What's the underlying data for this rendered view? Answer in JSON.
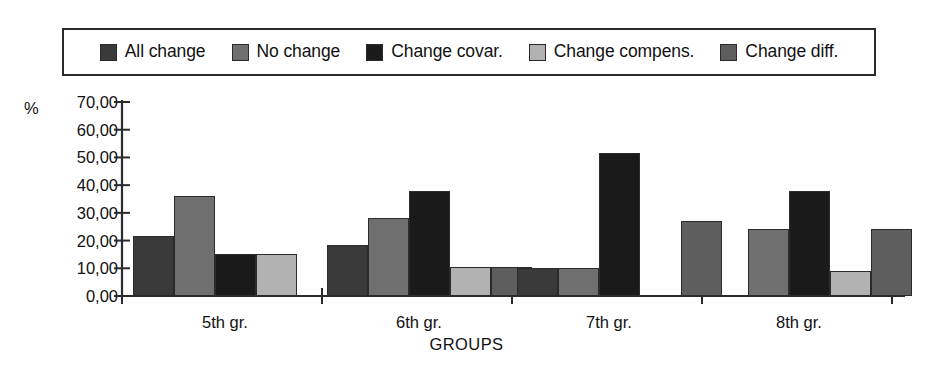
{
  "legend": {
    "position": "top",
    "bordered": true,
    "entries": [
      {
        "label": "All change",
        "color": "#3a3a3a"
      },
      {
        "label": "No change",
        "color": "#6f6f6f"
      },
      {
        "label": "Change covar.",
        "color": "#1a1a1a"
      },
      {
        "label": "Change compens.",
        "color": "#b2b2b2"
      },
      {
        "label": "Change diff.",
        "color": "#5e5e5e"
      }
    ]
  },
  "axes": {
    "y_title": "%",
    "x_title": "GROUPS",
    "y_tick_labels": [
      "70,00",
      "60,00",
      "50,00",
      "40,00",
      "30,00",
      "20,00",
      "10,00",
      "0,00"
    ]
  },
  "chart_data": {
    "type": "bar",
    "title": "",
    "subtitle": "",
    "xlabel": "GROUPS",
    "ylabel": "%",
    "ylim": [
      0,
      70
    ],
    "ytick_step": 10,
    "ytick_labels": [
      "0,00",
      "10,00",
      "20,00",
      "30,00",
      "40,00",
      "50,00",
      "60,00",
      "70,00"
    ],
    "grid": false,
    "legend_position": "top",
    "decimal_separator": ",",
    "categories": [
      "5th gr.",
      "6th gr.",
      "7th gr.",
      "8th gr."
    ],
    "series": [
      {
        "name": "All change",
        "color": "#3a3a3a",
        "values": [
          21.5,
          18.5,
          10.0,
          null
        ]
      },
      {
        "name": "No change",
        "color": "#6f6f6f",
        "values": [
          36.0,
          28.0,
          10.0,
          24.0
        ]
      },
      {
        "name": "Change covar.",
        "color": "#1a1a1a",
        "values": [
          15.0,
          38.0,
          51.5,
          38.0
        ]
      },
      {
        "name": "Change compens.",
        "color": "#b2b2b2",
        "values": [
          15.0,
          10.5,
          null,
          9.0
        ]
      },
      {
        "name": "Change diff.",
        "color": "#5e5e5e",
        "values": [
          null,
          10.5,
          27.0,
          24.0
        ]
      }
    ]
  }
}
